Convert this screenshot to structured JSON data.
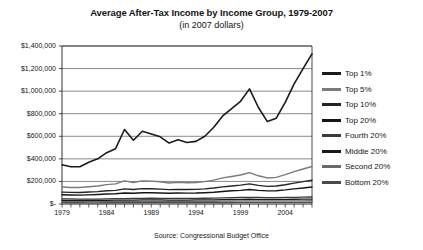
{
  "chart_data": {
    "type": "line",
    "title": "Average After-Tax Income by Income Group, 1979-2007",
    "subtitle": "(in 2007 dollars)",
    "source": "Source: Congressional Budget Office",
    "xlabel": "",
    "ylabel": "",
    "grid": true,
    "legend_position": "right",
    "xlim": [
      1979,
      2007
    ],
    "ylim": [
      0,
      1400000
    ],
    "ytick_step": 200000,
    "x": [
      1979,
      1980,
      1981,
      1982,
      1983,
      1984,
      1985,
      1986,
      1987,
      1988,
      1989,
      1990,
      1991,
      1992,
      1993,
      1994,
      1995,
      1996,
      1997,
      1998,
      1999,
      2000,
      2001,
      2002,
      2003,
      2004,
      2005,
      2006,
      2007
    ],
    "xticks": [
      1979,
      1980,
      1981,
      1982,
      1983,
      1984,
      1985,
      1986,
      1987,
      1988,
      1989,
      1990,
      1991,
      1992,
      1993,
      1994,
      1995,
      1996,
      1997,
      1998,
      1999,
      2000,
      2001,
      2002,
      2003,
      2004,
      2005,
      2006,
      2007
    ],
    "xtick_labels_shown": [
      "1979",
      "1984",
      "1989",
      "1994",
      "1999",
      "2004"
    ],
    "ytick_labels": [
      "$1,400,000",
      "$1,200,000",
      "$1,000,000",
      "$800,000",
      "$600,000",
      "$400,000",
      "$200,000",
      "$-"
    ],
    "ytick_values": [
      1400000,
      1200000,
      1000000,
      800000,
      600000,
      400000,
      200000,
      0
    ],
    "series": [
      {
        "name": "Top 1%",
        "color": "#1a1a1a",
        "width": 1.6,
        "values": [
          348000,
          330000,
          330000,
          370000,
          400000,
          455000,
          490000,
          660000,
          565000,
          645000,
          620000,
          595000,
          540000,
          570000,
          545000,
          555000,
          600000,
          680000,
          780000,
          845000,
          910000,
          1020000,
          855000,
          730000,
          760000,
          900000,
          1065000,
          1200000,
          1330000
        ]
      },
      {
        "name": "Top 5%",
        "color": "#7a7a7a",
        "width": 1.4,
        "values": [
          150000,
          146000,
          146000,
          153000,
          160000,
          172000,
          178000,
          205000,
          190000,
          205000,
          203000,
          197000,
          186000,
          192000,
          188000,
          190000,
          198000,
          212000,
          231000,
          244000,
          257000,
          278000,
          250000,
          231000,
          236000,
          260000,
          287000,
          310000,
          332000
        ]
      },
      {
        "name": "Top 10%",
        "color": "#242424",
        "width": 1.4,
        "values": [
          105000,
          103000,
          102000,
          106000,
          110000,
          117000,
          121000,
          134000,
          128000,
          136000,
          135000,
          132000,
          127000,
          130000,
          128000,
          130000,
          134000,
          142000,
          152000,
          160000,
          167000,
          178000,
          165000,
          156000,
          159000,
          171000,
          185000,
          198000,
          210000
        ]
      },
      {
        "name": "Top 20%",
        "color": "#151515",
        "width": 1.4,
        "values": [
          82000,
          80000,
          79000,
          81000,
          84000,
          88000,
          91000,
          98000,
          95000,
          100000,
          100000,
          98000,
          95000,
          97000,
          96000,
          97000,
          100000,
          104000,
          111000,
          117000,
          121000,
          128000,
          121000,
          116000,
          118000,
          125000,
          134000,
          142000,
          150000
        ]
      },
      {
        "name": "Fourth 20%",
        "color": "#3a3a3a",
        "width": 1.3,
        "values": [
          46000,
          45000,
          44000,
          44000,
          44000,
          46000,
          47000,
          48000,
          49000,
          50000,
          51000,
          50000,
          49000,
          49000,
          49000,
          50000,
          51000,
          52000,
          54000,
          56000,
          58000,
          59000,
          58000,
          57000,
          57000,
          58000,
          59000,
          61000,
          62000
        ]
      },
      {
        "name": "Middle 20%",
        "color": "#1a1a1a",
        "width": 1.3,
        "values": [
          33000,
          32000,
          32000,
          32000,
          32000,
          33000,
          34000,
          35000,
          35000,
          36000,
          36000,
          36000,
          35000,
          35000,
          35000,
          36000,
          36000,
          37000,
          38000,
          40000,
          41000,
          42000,
          41000,
          41000,
          41000,
          41000,
          42000,
          43000,
          44000
        ]
      },
      {
        "name": "Second 20%",
        "color": "#6a6a6a",
        "width": 1.3,
        "values": [
          22000,
          21000,
          21000,
          21000,
          21000,
          22000,
          22000,
          23000,
          23000,
          23000,
          24000,
          24000,
          23000,
          23000,
          23000,
          23000,
          24000,
          24000,
          25000,
          26000,
          27000,
          27000,
          27000,
          27000,
          27000,
          27000,
          28000,
          28000,
          29000
        ]
      },
      {
        "name": "Bottom 20%",
        "color": "#4a4a4a",
        "width": 1.3,
        "values": [
          11500,
          11000,
          11000,
          10800,
          10800,
          11000,
          11200,
          11500,
          11700,
          12000,
          12200,
          12000,
          11800,
          11900,
          11900,
          12000,
          12200,
          12500,
          13000,
          13500,
          14000,
          14500,
          14400,
          14300,
          14300,
          14400,
          14600,
          14800,
          15000
        ]
      }
    ]
  },
  "legend": {
    "items": [
      {
        "label": "Top 1%",
        "color": "#1a1a1a"
      },
      {
        "label": "Top 5%",
        "color": "#7a7a7a"
      },
      {
        "label": "Top 10%",
        "color": "#242424"
      },
      {
        "label": "Top 20%",
        "color": "#151515"
      },
      {
        "label": "Fourth 20%",
        "color": "#3a3a3a"
      },
      {
        "label": "Middle 20%",
        "color": "#1a1a1a"
      },
      {
        "label": "Second 20%",
        "color": "#6a6a6a"
      },
      {
        "label": "Bottom 20%",
        "color": "#4a4a4a"
      }
    ]
  },
  "axes": {
    "plot_left": 62,
    "plot_right": 312,
    "plot_top": 46,
    "plot_bottom": 204
  }
}
